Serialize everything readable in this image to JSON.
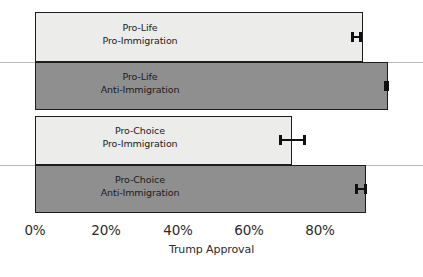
{
  "chart_data": {
    "type": "bar",
    "orientation": "horizontal",
    "title": "",
    "xlabel": "Trump Approval",
    "ylabel": "",
    "xlim": [
      0,
      100
    ],
    "xticks": [
      0,
      20,
      40,
      60,
      80
    ],
    "xticklabels": [
      "0%",
      "20%",
      "40%",
      "60%",
      "80%"
    ],
    "grid": false,
    "legend": "none",
    "categories": [
      "Pro-Life Pro-Immigration",
      "Pro-Life Anti-Immigration",
      "Pro-Choice Pro-Immigration",
      "Pro-Choice Anti-Immigration"
    ],
    "values": [
      92,
      99,
      72,
      93
    ],
    "error_low": [
      90.5,
      98.2,
      68.5,
      91.5
    ],
    "error_high": [
      93.5,
      99.6,
      76.0,
      94.5
    ],
    "bars": [
      {
        "line1": "Pro-Life",
        "line2": "Pro-Immigration",
        "value": 92,
        "err_low": 90.5,
        "err_high": 93.5,
        "shade": "light"
      },
      {
        "line1": "Pro-Life",
        "line2": "Anti-Immigration",
        "value": 99,
        "err_low": 98.2,
        "err_high": 99.6,
        "shade": "dark"
      },
      {
        "line1": "Pro-Choice",
        "line2": "Pro-Immigration",
        "value": 72,
        "err_low": 68.5,
        "err_high": 76.0,
        "shade": "light"
      },
      {
        "line1": "Pro-Choice",
        "line2": "Anti-Immigration",
        "value": 93,
        "err_low": 91.5,
        "err_high": 94.5,
        "shade": "dark"
      }
    ],
    "colors": {
      "light_bar": "#ececeb",
      "dark_bar": "#8f8f8f",
      "bar_outline": "#1c1c1c",
      "error_bar": "#101010",
      "gridline": "#b9b9b9",
      "text": "#1b1b1b",
      "background": "#ffffff"
    }
  }
}
